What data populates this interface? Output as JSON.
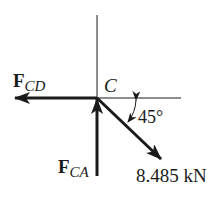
{
  "diagram": {
    "type": "free-body-diagram",
    "point": {
      "label": "C"
    },
    "forces": [
      {
        "id": "fcd",
        "symbol": "F",
        "subscript": "CD",
        "direction": "left"
      },
      {
        "id": "fca",
        "symbol": "F",
        "subscript": "CA",
        "direction": "up"
      },
      {
        "id": "applied",
        "magnitude_label": "8.485 kN",
        "direction": "down-right",
        "angle_label": "45°"
      }
    ],
    "colors": {
      "ink": "#1a1a1a",
      "background": "#ffffff"
    }
  }
}
